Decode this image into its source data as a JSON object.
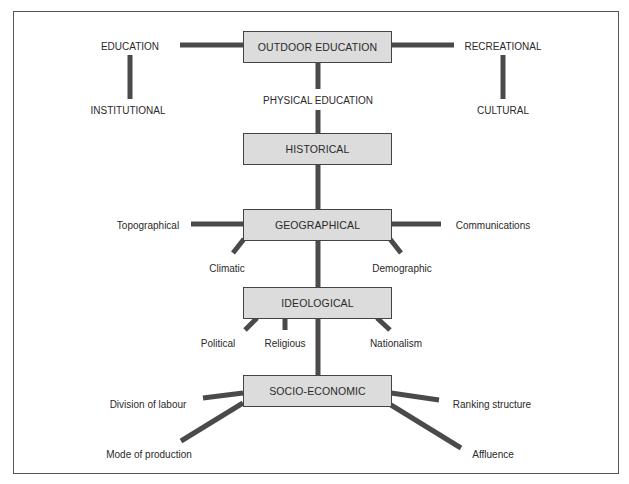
{
  "diagram": {
    "line_color": "#4a4a4a",
    "box_fill": "#dcdcdc",
    "boxes": {
      "outdoor": "OUTDOOR EDUCATION",
      "historical": "HISTORICAL",
      "geographical": "GEOGRAPHICAL",
      "ideological": "IDEOLOGICAL",
      "socio": "SOCIO-ECONOMIC"
    },
    "labels": {
      "education": "EDUCATION",
      "institutional": "INSTITUTIONAL",
      "recreational": "RECREATIONAL",
      "cultural": "CULTURAL",
      "physical_education": "PHYSICAL EDUCATION",
      "topographical": "Topographical",
      "communications": "Communications",
      "climatic": "Climatic",
      "demographic": "Demographic",
      "political": "Political",
      "religious": "Religious",
      "nationalism": "Nationalism",
      "division_of_labour": "Division of labour",
      "ranking_structure": "Ranking structure",
      "mode_of_production": "Mode of production",
      "affluence": "Affluence"
    }
  }
}
